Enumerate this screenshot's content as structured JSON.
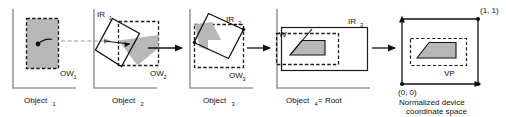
{
  "figure": {
    "background_color": "#ffffff",
    "line_color": "#111111",
    "fill_gray": "#b8b8b8",
    "axis_gray": "#9a9a9a"
  },
  "panels": [
    {
      "id": "panel-1",
      "caption": "Object",
      "caption_sub": "1",
      "window_label": "OW",
      "window_label_sub": "1",
      "has_instance_rect": false,
      "instance_label": "",
      "instance_label_sub": "",
      "shape_note": "gray filled dashed rectangle with pivot dot and curved arrow"
    },
    {
      "id": "panel-2",
      "caption": "Object",
      "caption_sub": "2",
      "window_label": "OW",
      "window_label_sub": "2",
      "has_instance_rect": true,
      "instance_label": "IR",
      "instance_label_sub": "1",
      "shape_note": "rotated instance rectangle overlapping dashed output window, gray intersection sliver"
    },
    {
      "id": "panel-3",
      "caption": "Object",
      "caption_sub": "3",
      "window_label": "OW",
      "window_label_sub": "3",
      "has_instance_rect": true,
      "instance_label": "IR",
      "instance_label_sub": "2",
      "shape_note": "rotated instance rectangle inside dashed output window with gray clipped polygon"
    },
    {
      "id": "panel-4",
      "caption": "Object",
      "caption_sub": "4",
      "caption_tail": " = Root",
      "window_label": "W",
      "window_label_sub": "",
      "has_instance_rect": true,
      "instance_label": "IR",
      "instance_label_sub": "3",
      "shape_note": "wide instance rectangle, dashed window W, gray trapezoid"
    },
    {
      "id": "panel-5",
      "caption_line1": "Normalized device",
      "caption_line2": "coordinate space",
      "corner_origin": "(0, 0)",
      "corner_far": "(1, 1)",
      "viewport_label": "VP",
      "shape_note": "unit square with arrow axes, dashed viewport rectangle, gray trapezoid"
    }
  ],
  "connectors": [
    {
      "id": "connector-1",
      "style": "dashed-gray",
      "from": "panel-1",
      "to": "panel-2"
    },
    {
      "id": "connector-2",
      "style": "solid-black",
      "from": "panel-2",
      "to": "panel-3"
    },
    {
      "id": "connector-3",
      "style": "solid-black",
      "from": "panel-3",
      "to": "panel-4"
    },
    {
      "id": "connector-4",
      "style": "solid-black",
      "from": "panel-4",
      "to": "panel-5"
    }
  ]
}
